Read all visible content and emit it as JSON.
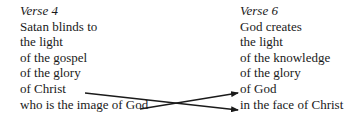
{
  "left": {
    "heading": "Verse 4",
    "lines": [
      "Satan blinds to",
      "the light",
      "of the gospel",
      "of the glory",
      "of Christ",
      "who is the image of God"
    ]
  },
  "right": {
    "heading": "Verse 6",
    "lines": [
      "God creates",
      "the light",
      "of the knowledge",
      "of the glory",
      "of God",
      "in the face of Christ"
    ]
  },
  "arrows": [
    {
      "from": "of Christ",
      "to": "in the face of Christ"
    },
    {
      "from": "who is the image of God",
      "to": "of God"
    }
  ]
}
